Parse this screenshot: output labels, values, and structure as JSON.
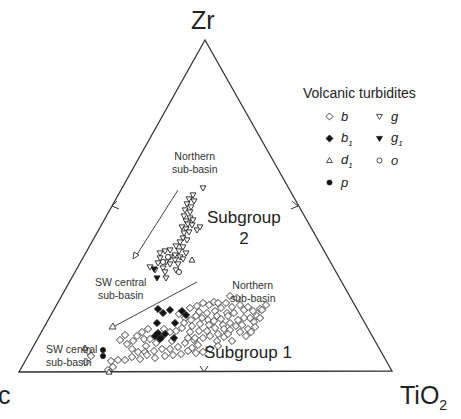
{
  "chart_data": {
    "type": "ternary-scatter",
    "vertices": {
      "top": "Zr",
      "left": "c",
      "right": "TiO2"
    },
    "vertex_labels_display": {
      "top": "Zr",
      "left": "c",
      "right_main": "TiO",
      "right_sub": "2"
    },
    "midpoint_ticks": [
      "left-edge",
      "right-edge",
      "bottom-edge"
    ],
    "legend": {
      "title": "Volcanic turbidites",
      "entries": [
        {
          "key": "b",
          "symbol": "open-diamond",
          "label": "b",
          "sub": ""
        },
        {
          "key": "g",
          "symbol": "open-triangle-down",
          "label": "g",
          "sub": ""
        },
        {
          "key": "b1",
          "symbol": "filled-diamond",
          "label": "b",
          "sub": "1"
        },
        {
          "key": "g1",
          "symbol": "filled-triangle-down",
          "label": "g",
          "sub": "1"
        },
        {
          "key": "d1",
          "symbol": "open-triangle-up",
          "label": "d",
          "sub": "1"
        },
        {
          "key": "o",
          "symbol": "open-circle",
          "label": "o",
          "sub": ""
        },
        {
          "key": "p",
          "symbol": "filled-circle",
          "label": "p",
          "sub": ""
        }
      ]
    },
    "annotations": {
      "northern_upper": [
        "Northern",
        "sub-basin"
      ],
      "sw_central_upper": [
        "SW central",
        "sub-basin"
      ],
      "northern_lower": [
        "Northern",
        "sub-basin"
      ],
      "sw_central_lower": [
        "SW central",
        "sub-basin"
      ],
      "subgroup2": [
        "Subgroup",
        "2"
      ],
      "subgroup1": "Subgroup 1"
    },
    "arrows": [
      {
        "name": "trend-arrow-subgroup2",
        "from": [
          178,
          190
        ],
        "to": [
          134,
          259
        ]
      },
      {
        "name": "trend-arrow-subgroup1",
        "from": [
          197,
          282
        ],
        "to": [
          110,
          329
        ]
      }
    ],
    "points_px": {
      "g": [
        [
          203,
          188
        ],
        [
          193,
          195
        ],
        [
          189,
          199
        ],
        [
          194,
          201
        ],
        [
          187,
          204
        ],
        [
          191,
          207
        ],
        [
          185,
          210
        ],
        [
          190,
          212
        ],
        [
          184,
          216
        ],
        [
          190,
          218
        ],
        [
          186,
          221
        ],
        [
          193,
          220
        ],
        [
          188,
          224
        ],
        [
          182,
          227
        ],
        [
          186,
          229
        ],
        [
          192,
          225
        ],
        [
          184,
          233
        ],
        [
          189,
          232
        ],
        [
          197,
          230
        ],
        [
          183,
          238
        ],
        [
          187,
          240
        ],
        [
          180,
          242
        ],
        [
          200,
          227
        ],
        [
          183,
          247
        ],
        [
          176,
          246
        ],
        [
          170,
          250
        ],
        [
          179,
          251
        ],
        [
          165,
          251
        ],
        [
          175,
          255
        ],
        [
          180,
          257
        ],
        [
          186,
          253
        ],
        [
          170,
          257
        ],
        [
          160,
          253
        ],
        [
          166,
          262
        ],
        [
          158,
          263
        ],
        [
          163,
          268
        ],
        [
          170,
          264
        ],
        [
          150,
          267
        ],
        [
          165,
          272
        ],
        [
          175,
          260
        ],
        [
          166,
          278
        ],
        [
          183,
          259
        ],
        [
          178,
          264
        ],
        [
          176,
          270
        ],
        [
          160,
          258
        ],
        [
          155,
          270
        ]
      ],
      "g1": [
        [
          154,
          269
        ],
        [
          157,
          278
        ]
      ],
      "o": [
        [
          179,
          272
        ],
        [
          163,
          262
        ],
        [
          168,
          257
        ]
      ],
      "d1": [
        [
          85,
          348
        ],
        [
          109,
          372
        ],
        [
          192,
          260
        ]
      ],
      "p": [
        [
          103,
          350
        ],
        [
          103,
          356
        ]
      ],
      "b1": [
        [
          158,
          309
        ],
        [
          163,
          313
        ],
        [
          170,
          310
        ],
        [
          157,
          323
        ],
        [
          155,
          336
        ],
        [
          161,
          338
        ],
        [
          165,
          334
        ],
        [
          160,
          339
        ],
        [
          158,
          333
        ],
        [
          175,
          323
        ],
        [
          182,
          311
        ],
        [
          186,
          315
        ],
        [
          174,
          338
        ]
      ],
      "b": [
        [
          209,
          305
        ],
        [
          203,
          303
        ],
        [
          214,
          302
        ],
        [
          197,
          306
        ],
        [
          190,
          308
        ],
        [
          199,
          312
        ],
        [
          207,
          313
        ],
        [
          215,
          311
        ],
        [
          221,
          308
        ],
        [
          226,
          303
        ],
        [
          232,
          307
        ],
        [
          227,
          313
        ],
        [
          217,
          316
        ],
        [
          208,
          320
        ],
        [
          202,
          318
        ],
        [
          196,
          316
        ],
        [
          191,
          320
        ],
        [
          185,
          318
        ],
        [
          179,
          314
        ],
        [
          184,
          323
        ],
        [
          192,
          326
        ],
        [
          200,
          324
        ],
        [
          209,
          325
        ],
        [
          214,
          321
        ],
        [
          221,
          319
        ],
        [
          228,
          316
        ],
        [
          234,
          313
        ],
        [
          238,
          320
        ],
        [
          230,
          323
        ],
        [
          223,
          325
        ],
        [
          215,
          328
        ],
        [
          207,
          331
        ],
        [
          199,
          331
        ],
        [
          190,
          332
        ],
        [
          182,
          328
        ],
        [
          176,
          331
        ],
        [
          170,
          332
        ],
        [
          164,
          329
        ],
        [
          148,
          329
        ],
        [
          142,
          332
        ],
        [
          137,
          336
        ],
        [
          144,
          339
        ],
        [
          150,
          339
        ],
        [
          156,
          343
        ],
        [
          146,
          346
        ],
        [
          133,
          341
        ],
        [
          127,
          344
        ],
        [
          132,
          349
        ],
        [
          138,
          352
        ],
        [
          145,
          352
        ],
        [
          172,
          341
        ],
        [
          178,
          347
        ],
        [
          170,
          349
        ],
        [
          188,
          338
        ],
        [
          194,
          340
        ],
        [
          198,
          345
        ],
        [
          192,
          348
        ],
        [
          185,
          343
        ],
        [
          111,
          361
        ],
        [
          113,
          367
        ],
        [
          88,
          351
        ],
        [
          91,
          356
        ],
        [
          86,
          362
        ],
        [
          108,
          370
        ],
        [
          118,
          360
        ],
        [
          125,
          360
        ],
        [
          132,
          357
        ],
        [
          140,
          359
        ],
        [
          147,
          355
        ],
        [
          154,
          351
        ],
        [
          162,
          349
        ],
        [
          165,
          356
        ],
        [
          155,
          358
        ],
        [
          173,
          355
        ],
        [
          181,
          354
        ],
        [
          188,
          351
        ],
        [
          125,
          335
        ],
        [
          120,
          340
        ],
        [
          218,
          334
        ],
        [
          224,
          329
        ],
        [
          230,
          330
        ],
        [
          236,
          326
        ],
        [
          242,
          325
        ],
        [
          244,
          310
        ],
        [
          195,
          338
        ],
        [
          203,
          338
        ],
        [
          210,
          336
        ],
        [
          217,
          341
        ],
        [
          224,
          337
        ],
        [
          232,
          341
        ],
        [
          228,
          334
        ],
        [
          240,
          332
        ],
        [
          218,
          303
        ],
        [
          230,
          296
        ],
        [
          237,
          298
        ],
        [
          240,
          305
        ],
        [
          248,
          307
        ],
        [
          253,
          311
        ],
        [
          260,
          309
        ],
        [
          266,
          305
        ],
        [
          257,
          316
        ],
        [
          250,
          318
        ],
        [
          244,
          318
        ],
        [
          254,
          322
        ],
        [
          248,
          329
        ],
        [
          255,
          327
        ],
        [
          260,
          318
        ],
        [
          251,
          332
        ],
        [
          246,
          336
        ],
        [
          210,
          349
        ],
        [
          203,
          352
        ],
        [
          196,
          353
        ],
        [
          218,
          346
        ],
        [
          262,
          310
        ]
      ]
    }
  }
}
